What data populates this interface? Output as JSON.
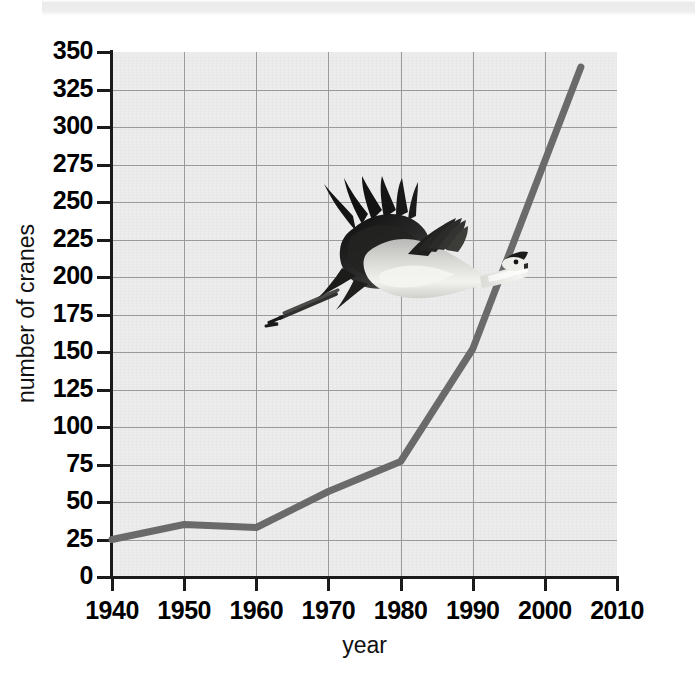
{
  "figure": {
    "photo_caption": "whooping-crane-in-flight"
  },
  "chart_data": {
    "type": "line",
    "title": "",
    "xlabel": "year",
    "ylabel": "number of cranes",
    "xlim": [
      1940,
      2010
    ],
    "ylim": [
      0,
      350
    ],
    "grid": true,
    "legend": "none",
    "x_ticks": [
      "1940",
      "1950",
      "1960",
      "1970",
      "1980",
      "1990",
      "2000",
      "2010"
    ],
    "y_ticks": [
      "0",
      "25",
      "50",
      "75",
      "100",
      "125",
      "150",
      "175",
      "200",
      "225",
      "250",
      "275",
      "300",
      "325",
      "350"
    ],
    "x": [
      1940,
      1950,
      1960,
      1970,
      1980,
      1990,
      2005
    ],
    "values": [
      25,
      35,
      33,
      57,
      77,
      152,
      340
    ],
    "series": [
      {
        "name": "number of cranes",
        "color": "#6a6a6a",
        "points": [
          {
            "year": 1940,
            "cranes": 25
          },
          {
            "year": 1950,
            "cranes": 35
          },
          {
            "year": 1960,
            "cranes": 33
          },
          {
            "year": 1970,
            "cranes": 57
          },
          {
            "year": 1980,
            "cranes": 77
          },
          {
            "year": 1990,
            "cranes": 152
          },
          {
            "year": 2005,
            "cranes": 340
          }
        ]
      }
    ]
  },
  "colors": {
    "line": "#6a6a6a",
    "grid": "#9a9a9a",
    "axis": "#1b1b1b",
    "plot_background": "#ececed",
    "page_background": "#ffffff"
  }
}
